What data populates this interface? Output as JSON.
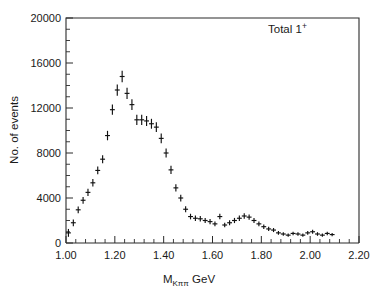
{
  "chart_data": {
    "type": "scatter",
    "title": "",
    "annotation": "Total 1",
    "annotation_superscript": "+",
    "xlabel_main": "M",
    "xlabel_subscript": "Kππ",
    "xlabel_unit": "GeV",
    "ylabel": "No. of events",
    "xlim": [
      1.0,
      2.2
    ],
    "ylim": [
      0,
      20000
    ],
    "x_major_step": 0.2,
    "x_minor_step": 0.04,
    "y_major_step": 4000,
    "y_minor_step": 1000,
    "grid": false,
    "legend": "none",
    "bin_width": 0.02,
    "xticklabels": [
      "1.00",
      "1.20",
      "1.40",
      "1.60",
      "1.80",
      "2.00",
      "2.20"
    ],
    "xtickvalues": [
      1.0,
      1.2,
      1.4,
      1.6,
      1.8,
      2.0,
      2.2
    ],
    "yticklabels": [
      "0",
      "4000",
      "8000",
      "12000",
      "16000",
      "20000"
    ],
    "ytickvalues": [
      0,
      4000,
      8000,
      12000,
      16000,
      20000
    ],
    "marker": "cross-with-errorbar",
    "x": [
      1.01,
      1.03,
      1.05,
      1.07,
      1.09,
      1.11,
      1.13,
      1.15,
      1.17,
      1.19,
      1.21,
      1.23,
      1.25,
      1.27,
      1.29,
      1.31,
      1.33,
      1.35,
      1.37,
      1.39,
      1.41,
      1.43,
      1.45,
      1.47,
      1.49,
      1.51,
      1.53,
      1.55,
      1.57,
      1.59,
      1.61,
      1.63,
      1.65,
      1.67,
      1.69,
      1.71,
      1.73,
      1.75,
      1.77,
      1.79,
      1.81,
      1.83,
      1.85,
      1.87,
      1.89,
      1.91,
      1.93,
      1.95,
      1.97,
      1.99,
      2.01,
      2.03,
      2.05,
      2.07,
      2.09
    ],
    "values": [
      900,
      1800,
      2950,
      3800,
      4500,
      5350,
      6450,
      7450,
      9550,
      11850,
      13600,
      14800,
      13300,
      12300,
      10950,
      10950,
      10850,
      10600,
      10300,
      9300,
      8000,
      6500,
      4900,
      4000,
      3000,
      2350,
      2200,
      2150,
      2000,
      1900,
      1700,
      2350,
      1600,
      1800,
      2000,
      2200,
      2400,
      2300,
      2000,
      1700,
      1450,
      1250,
      1150,
      900,
      800,
      700,
      850,
      800,
      700,
      900,
      1000,
      800,
      700,
      850,
      750
    ],
    "errors": [
      350,
      300,
      300,
      300,
      320,
      330,
      340,
      360,
      420,
      460,
      500,
      520,
      500,
      480,
      460,
      450,
      450,
      440,
      440,
      430,
      400,
      370,
      330,
      300,
      270,
      250,
      240,
      240,
      230,
      230,
      220,
      240,
      210,
      220,
      230,
      240,
      250,
      240,
      230,
      210,
      200,
      190,
      180,
      170,
      160,
      150,
      160,
      160,
      150,
      160,
      170,
      160,
      150,
      160,
      150
    ]
  },
  "colors": {
    "ink": "#1a1a1a",
    "axis": "#2b2b2b",
    "marker": "#111111",
    "background": "#ffffff"
  }
}
